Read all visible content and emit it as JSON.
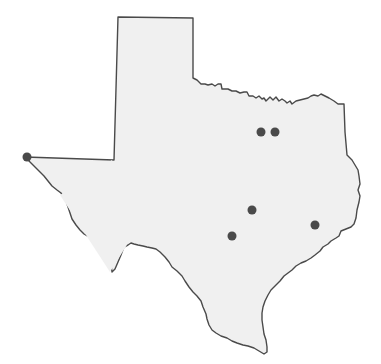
{
  "map": {
    "region": "Texas",
    "fill_color": "#f0f0f0",
    "border_color": "#4a4a4a",
    "marker_color": "#4a4a4a",
    "markers": [
      {
        "name": "marker-1",
        "x": 27,
        "y": 157
      },
      {
        "name": "marker-2",
        "x": 261,
        "y": 132
      },
      {
        "name": "marker-3",
        "x": 275,
        "y": 132
      },
      {
        "name": "marker-4",
        "x": 252,
        "y": 210
      },
      {
        "name": "marker-5",
        "x": 232,
        "y": 236
      },
      {
        "name": "marker-6",
        "x": 315,
        "y": 225
      }
    ]
  }
}
